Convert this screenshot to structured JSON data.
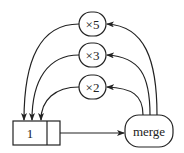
{
  "diagram": {
    "nodes": {
      "times5": {
        "label": "×5"
      },
      "times3": {
        "label": "×3"
      },
      "times2": {
        "label": "×2"
      },
      "merge": {
        "label": "merge"
      },
      "cell": {
        "label": "1"
      }
    },
    "edges": [
      {
        "from": "merge",
        "to": "times5"
      },
      {
        "from": "merge",
        "to": "times3"
      },
      {
        "from": "merge",
        "to": "times2"
      },
      {
        "from": "times5",
        "to": "cell"
      },
      {
        "from": "times3",
        "to": "cell"
      },
      {
        "from": "times2",
        "to": "cell"
      },
      {
        "from": "cell",
        "to": "merge"
      }
    ],
    "colors": {
      "stroke": "#222222",
      "background": "#ffffff"
    }
  }
}
